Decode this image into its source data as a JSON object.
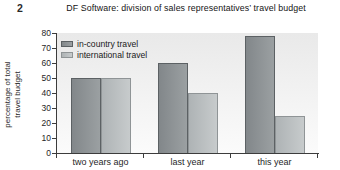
{
  "page": {
    "question_number": "2"
  },
  "chart_data": {
    "type": "bar",
    "title": "DF Software: division of sales representatives’ travel budget",
    "categories": [
      "two years ago",
      "last year",
      "this year"
    ],
    "series": [
      {
        "name": "in-country travel",
        "values": [
          50,
          60,
          78
        ],
        "color": "#82878a",
        "color_light": "#9ba0a2",
        "border": "#5c6164"
      },
      {
        "name": "international travel",
        "values": [
          50,
          40,
          25
        ],
        "color": "#aeb3b5",
        "color_light": "#c7cbcc",
        "border": "#8f9496"
      }
    ],
    "ylabel": "percentage of total travel budget",
    "ylabel_lines": [
      "percentage of total",
      "travel budget"
    ],
    "ylim": [
      0,
      80
    ],
    "yticks": [
      0,
      10,
      20,
      30,
      40,
      50,
      60,
      70,
      80
    ],
    "grid": false,
    "legend_position": "top-left",
    "axis_color": "#3c3c3c"
  }
}
